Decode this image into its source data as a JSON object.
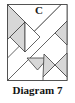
{
  "figure": {
    "label": "C",
    "caption": "Diagram 7",
    "colors": {
      "line": "#3f3f3f",
      "shade": "#d7d7d7",
      "background": "#ffffff"
    },
    "square": {
      "x": 7.5,
      "y": 4.5,
      "width": 59.5,
      "height": 76
    },
    "shapes": [
      {
        "name": "strip-parallelogram",
        "fill": "background",
        "points": "7.5,58 61,4.5 67,4.5 67,21 7.5,80.5"
      },
      {
        "name": "top-large-triangle",
        "fill": "background",
        "points": "7.5,4.5 61,4.5 34,31.5"
      },
      {
        "name": "upper-left-triangle",
        "fill": "shade",
        "points": "7.5,4.5 25,22 7.5,39.5"
      },
      {
        "name": "diamond-left-half",
        "fill": "shade",
        "points": "25,22 10,37 25,52"
      },
      {
        "name": "diamond-right-half",
        "fill": "background",
        "points": "25,22 40,37 25,52"
      },
      {
        "name": "right-edge-triangle",
        "fill": "shade",
        "points": "67,21 67,45 55,33"
      },
      {
        "name": "bottom-inverted-triangle",
        "fill": "shade",
        "points": "27,58 48,58 37.5,70"
      },
      {
        "name": "x-left-triangle",
        "fill": "shade",
        "points": "44,54 55,65 43,77"
      },
      {
        "name": "x-right-triangle",
        "fill": "shade",
        "points": "67,53 67,77 55,65"
      },
      {
        "name": "x-bottom-triangle",
        "fill": "background",
        "points": "43,77 55,65 67,77 67,80.5 43,80.5"
      }
    ]
  }
}
